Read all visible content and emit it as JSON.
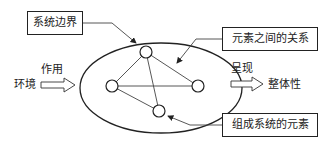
{
  "diagram": {
    "callouts": {
      "system_boundary": "系统边界",
      "relations": "元素之间的关系",
      "elements": "组成系统的元素"
    },
    "input": {
      "source": "环境",
      "action": "作用"
    },
    "output": {
      "action": "呈现",
      "result": "整体性"
    },
    "nodes": [
      {
        "id": "top",
        "x": 146,
        "y": 52
      },
      {
        "id": "left",
        "x": 112,
        "y": 86
      },
      {
        "id": "right",
        "x": 198,
        "y": 86
      },
      {
        "id": "bottom",
        "x": 159,
        "y": 111
      }
    ],
    "edges": [
      [
        "top",
        "left"
      ],
      [
        "top",
        "right"
      ],
      [
        "top",
        "bottom"
      ],
      [
        "left",
        "right"
      ],
      [
        "left",
        "bottom"
      ]
    ],
    "colors": {
      "stroke": "#222222",
      "background": "#ffffff"
    }
  }
}
